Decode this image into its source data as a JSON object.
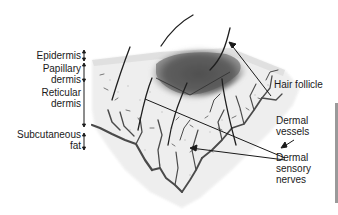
{
  "figure": {
    "layer_labels": [
      {
        "id": "epidermis",
        "lines": [
          "Epidermis"
        ]
      },
      {
        "id": "papillary-dermis",
        "lines": [
          "Papillary",
          "dermis"
        ]
      },
      {
        "id": "reticular-dermis",
        "lines": [
          "Reticular",
          "dermis"
        ]
      },
      {
        "id": "subcutaneous-fat",
        "lines": [
          "Subcutaneous",
          "fat"
        ]
      }
    ],
    "callouts": [
      {
        "id": "hair-follicle",
        "lines": [
          "Hair follicle"
        ]
      },
      {
        "id": "dermal-vessels",
        "lines": [
          "Dermal",
          "vessels"
        ]
      },
      {
        "id": "dermal-sensory-nerves",
        "lines": [
          "Dermal",
          "sensory",
          "nerves"
        ]
      }
    ],
    "colors": {
      "ink": "#1a1a1a",
      "vessel": "#4a4a4a",
      "follicle_shade": "#5a5a5a",
      "tissue": "#e6e6e6",
      "edge_bar": "#9a9a9a"
    }
  }
}
